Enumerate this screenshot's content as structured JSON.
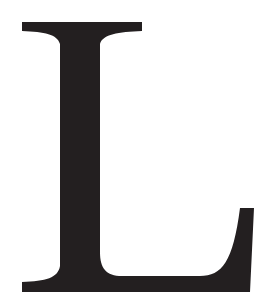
{
  "glyph": {
    "character": "L",
    "style": "serif capital letter",
    "fill_color": "#231f20",
    "background_color": "#ffffff"
  }
}
